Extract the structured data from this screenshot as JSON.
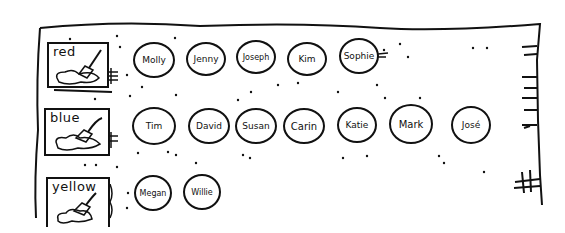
{
  "diagram": {
    "type": "hand-drawn sketch",
    "frame": "outer open-bottomed box with tick marks on right edge",
    "groups": [
      {
        "label": "red",
        "icon": "paint-brush-splash-icon",
        "members": [
          "Molly",
          "Jenny",
          "Joseph",
          "Kim",
          "Sophie"
        ]
      },
      {
        "label": "blue",
        "icon": "paint-brush-splash-icon",
        "members": [
          "Tim",
          "David",
          "Susan",
          "Carin",
          "Katie",
          "Mark",
          "José"
        ]
      },
      {
        "label": "yellow",
        "icon": "paint-brush-splash-icon",
        "members": [
          "Megan",
          "Willie"
        ]
      }
    ]
  },
  "colors": {
    "ink": "#111111",
    "paper": "#ffffff"
  }
}
